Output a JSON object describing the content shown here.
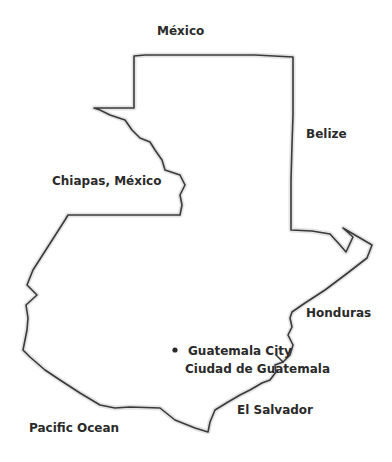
{
  "map": {
    "country": "Guatemala",
    "colors": {
      "border": "#3a3a3a",
      "text": "#2a2a2a",
      "background": "#ffffff"
    },
    "labels": {
      "mexico": "México",
      "belize": "Belize",
      "chiapas": "Chiapas, México",
      "honduras": "Honduras",
      "capital_en": "Guatemala City",
      "capital_es": "Ciudad de Guatemala",
      "el_salvador": "El Salvador",
      "pacific": "Pacific Ocean"
    },
    "capital_marker": {
      "x": 175,
      "y": 350
    }
  }
}
